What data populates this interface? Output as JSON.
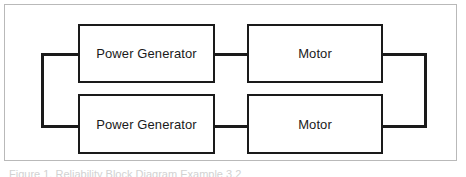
{
  "figure": {
    "type": "block-diagram",
    "background_color": "#ffffff",
    "frame_color": "#b9b9b9",
    "line_color": "#1a1a1a",
    "caption": "Figure 1. Reliability Block Diagram Example 3.2"
  },
  "blocks": [
    {
      "id": "pg-top",
      "label": "Power Generator",
      "row": "top",
      "column": "left"
    },
    {
      "id": "motor-top",
      "label": "Motor",
      "row": "top",
      "column": "right"
    },
    {
      "id": "pg-bottom",
      "label": "Power Generator",
      "row": "bottom",
      "column": "left"
    },
    {
      "id": "motor-bottom",
      "label": "Motor",
      "row": "bottom",
      "column": "right"
    }
  ],
  "connectors": [
    {
      "id": "left-spine",
      "orientation": "vertical"
    },
    {
      "id": "left-top",
      "orientation": "horizontal"
    },
    {
      "id": "left-bottom",
      "orientation": "horizontal"
    },
    {
      "id": "mid-top",
      "orientation": "horizontal"
    },
    {
      "id": "mid-bottom",
      "orientation": "horizontal"
    },
    {
      "id": "right-spine",
      "orientation": "vertical"
    },
    {
      "id": "right-top",
      "orientation": "horizontal"
    },
    {
      "id": "right-bottom",
      "orientation": "horizontal"
    }
  ]
}
